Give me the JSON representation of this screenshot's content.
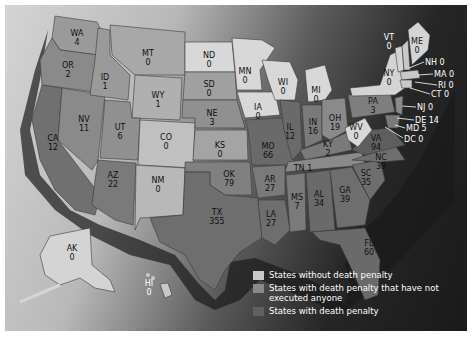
{
  "legend": {
    "items": [
      {
        "label": "States without death penalty",
        "color": "#c8c8c8"
      },
      {
        "label": "States with death penalty that have not executed anyone",
        "color": "#8a8a8a"
      },
      {
        "label": "States with death penalty",
        "color": "#606060"
      }
    ]
  },
  "states": {
    "WA": {
      "abbr": "WA",
      "value": "4"
    },
    "OR": {
      "abbr": "OR",
      "value": "2"
    },
    "CA": {
      "abbr": "CA",
      "value": "12"
    },
    "NV": {
      "abbr": "NV",
      "value": "11"
    },
    "ID": {
      "abbr": "ID",
      "value": "1"
    },
    "MT": {
      "abbr": "MT",
      "value": "0"
    },
    "WY": {
      "abbr": "WY",
      "value": "1"
    },
    "UT": {
      "abbr": "UT",
      "value": "6"
    },
    "AZ": {
      "abbr": "AZ",
      "value": "22"
    },
    "CO": {
      "abbr": "CO",
      "value": "0"
    },
    "NM": {
      "abbr": "NM",
      "value": "0"
    },
    "ND": {
      "abbr": "ND",
      "value": "0"
    },
    "SD": {
      "abbr": "SD",
      "value": "0"
    },
    "NE": {
      "abbr": "NE",
      "value": "3"
    },
    "KS": {
      "abbr": "KS",
      "value": "0"
    },
    "OK": {
      "abbr": "OK",
      "value": "79"
    },
    "TX": {
      "abbr": "TX",
      "value": "355"
    },
    "MN": {
      "abbr": "MN",
      "value": "0"
    },
    "IA": {
      "abbr": "IA",
      "value": "0"
    },
    "MO": {
      "abbr": "MO",
      "value": "66"
    },
    "AR": {
      "abbr": "AR",
      "value": "27"
    },
    "LA": {
      "abbr": "LA",
      "value": "27"
    },
    "WI": {
      "abbr": "WI",
      "value": "0"
    },
    "IL": {
      "abbr": "IL",
      "value": "12"
    },
    "MI": {
      "abbr": "MI",
      "value": "0"
    },
    "IN": {
      "abbr": "IN",
      "value": "16"
    },
    "OH": {
      "abbr": "OH",
      "value": "19"
    },
    "KY": {
      "abbr": "KY",
      "value": "2"
    },
    "TN": {
      "abbr": "TN",
      "value": "1"
    },
    "MS": {
      "abbr": "MS",
      "value": "7"
    },
    "AL": {
      "abbr": "AL",
      "value": "34"
    },
    "GA": {
      "abbr": "GA",
      "value": "39"
    },
    "FL": {
      "abbr": "FL",
      "value": "60"
    },
    "SC": {
      "abbr": "SC",
      "value": "35"
    },
    "NC": {
      "abbr": "NC",
      "value": "39"
    },
    "VA": {
      "abbr": "VA",
      "value": "94"
    },
    "WV": {
      "abbr": "WV",
      "value": "0"
    },
    "PA": {
      "abbr": "PA",
      "value": "3"
    },
    "NY": {
      "abbr": "NY",
      "value": "0"
    },
    "VT": {
      "abbr": "VT",
      "value": "0"
    },
    "ME": {
      "abbr": "ME",
      "value": "0"
    },
    "AK": {
      "abbr": "AK",
      "value": "0"
    },
    "HI": {
      "abbr": "HI",
      "value": "0"
    }
  },
  "callouts": {
    "NH": "NH 0",
    "MA": "MA 0",
    "RI": "RI 0",
    "CT": "CT 0",
    "NJ": "NJ 0",
    "DE": "DE 14",
    "MD": "MD 5",
    "DC": "DC 0"
  }
}
